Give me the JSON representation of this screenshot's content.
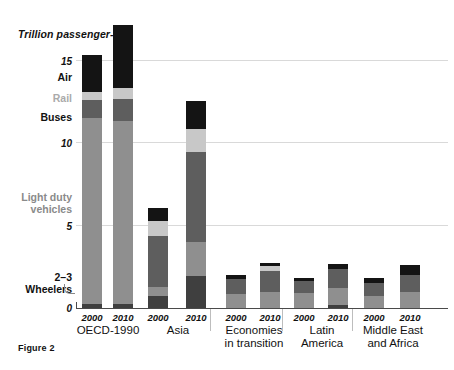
{
  "figure": {
    "caption": "Figure 2",
    "axis_title": "Trillion passenger-km"
  },
  "chart_data": {
    "type": "bar",
    "subtype": "stacked",
    "title": "",
    "xlabel": "",
    "ylabel": "Trillion passenger-km",
    "ylim": [
      0,
      17.5
    ],
    "yticks": [
      0,
      5,
      10,
      15
    ],
    "ytick_labels": [
      "0",
      "5",
      "10",
      "15"
    ],
    "grid": true,
    "legend_position": "left-inline-labels",
    "categories": [
      "OECD-1990 2000",
      "OECD-1990 2010",
      "Asia 2000",
      "Asia 2010",
      "Economies in transition 2000",
      "Economies in transition 2010",
      "Latin America 2000",
      "Latin America 2010",
      "Middle East and Africa 2000",
      "Middle East and Africa 2010"
    ],
    "series": [
      {
        "name": "2-3 Wheelers",
        "color": "#3f3f3f",
        "values": [
          0.25,
          0.25,
          0.75,
          1.95,
          0.0,
          0.0,
          0.0,
          0.2,
          0.0,
          0.0
        ]
      },
      {
        "name": "Light duty vehicles",
        "color": "#8f8f8f",
        "values": [
          11.3,
          11.1,
          0.55,
          2.05,
          0.85,
          0.95,
          0.9,
          1.0,
          0.7,
          0.95
        ]
      },
      {
        "name": "Buses",
        "color": "#5e5e5e",
        "values": [
          1.1,
          1.35,
          3.1,
          5.5,
          0.9,
          1.3,
          0.75,
          1.2,
          0.8,
          1.05
        ]
      },
      {
        "name": "Rail",
        "color": "#c8c8c8",
        "values": [
          0.5,
          0.65,
          0.9,
          1.35,
          0.0,
          0.3,
          0.0,
          0.0,
          0.0,
          0.0
        ]
      },
      {
        "name": "Air",
        "color": "#141414",
        "values": [
          2.25,
          3.85,
          0.8,
          1.75,
          0.25,
          0.2,
          0.2,
          0.25,
          0.35,
          0.6
        ]
      }
    ],
    "groups": [
      {
        "label": "OECD-1990",
        "years": [
          "2000",
          "2010"
        ]
      },
      {
        "label": "Asia",
        "years": [
          "2000",
          "2010"
        ]
      },
      {
        "label": "Economies\nin transition",
        "years": [
          "2000",
          "2010"
        ]
      },
      {
        "label": "Latin\nAmerica",
        "years": [
          "2000",
          "2010"
        ]
      },
      {
        "label": "Middle East\nand Africa",
        "years": [
          "2000",
          "2010"
        ]
      }
    ],
    "series_annotations": [
      {
        "label": "Air",
        "color": "#111111"
      },
      {
        "label": "Rail",
        "color": "#aaaaaa"
      },
      {
        "label": "Buses",
        "color": "#111111"
      },
      {
        "label": "Light duty\nvehicles",
        "color": "#8a8a8a"
      },
      {
        "label": "2–3\nWheelers",
        "color": "#111111"
      }
    ]
  }
}
